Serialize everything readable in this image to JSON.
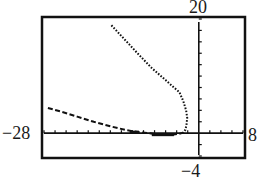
{
  "chart_data": {
    "type": "line",
    "title": "",
    "xlabel": "",
    "ylabel": "",
    "xlim": [
      -28,
      8
    ],
    "ylim": [
      -4,
      20
    ],
    "xscl": 2,
    "yscl": 2,
    "grid": false,
    "legend": null,
    "window_labels": {
      "ymax": "20",
      "xmin": "−28",
      "xmax": "8",
      "ymin": "−4"
    },
    "series": [
      {
        "name": "upper-branch",
        "style": "dotted",
        "points": [
          [
            -15.8,
            18.9
          ],
          [
            -13.5,
            16.5
          ],
          [
            -11.0,
            13.9
          ],
          [
            -8.5,
            11.4
          ],
          [
            -6.0,
            9.3
          ],
          [
            -4.5,
            8.0
          ],
          [
            -3.5,
            7.2
          ],
          [
            -2.8,
            5.6
          ],
          [
            -2.3,
            4.0
          ],
          [
            -2.1,
            2.7
          ],
          [
            -2.2,
            1.6
          ],
          [
            -2.4,
            0.6
          ],
          [
            -2.8,
            0.1
          ]
        ]
      },
      {
        "name": "lower-branch",
        "style": "dashed",
        "points": [
          [
            -27.3,
            4.4
          ],
          [
            -25.0,
            3.8
          ],
          [
            -22.0,
            2.9
          ],
          [
            -19.0,
            2.0
          ],
          [
            -16.0,
            1.2
          ],
          [
            -13.0,
            0.5
          ],
          [
            -11.0,
            0.2
          ],
          [
            -9.0,
            0.0
          ],
          [
            -7.0,
            -0.3
          ],
          [
            -5.0,
            -0.3
          ],
          [
            -3.5,
            -0.1
          ],
          [
            -2.8,
            0.1
          ]
        ]
      }
    ]
  },
  "labels": {
    "top": "20",
    "left": "−28",
    "right": "8",
    "bottom": "−4"
  }
}
